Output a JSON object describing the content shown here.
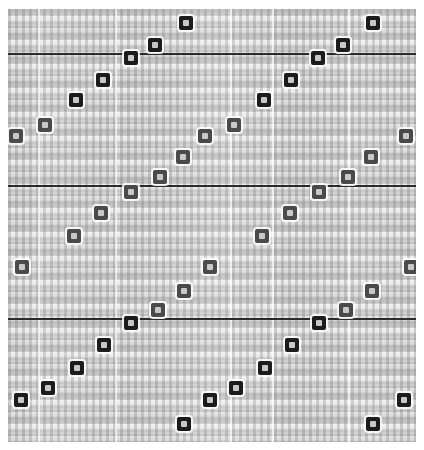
{
  "figure": {
    "title": "",
    "width": 424,
    "height": 450,
    "background_color": "#d2d2d2",
    "marker_dark_color": "#1c1c1c",
    "marker_mid_color": "#4a4a4a",
    "marker_light_color": "#6f6f6f",
    "marker_core_color": "#c8c8c8",
    "reference_line_color": "#2b2b2b",
    "gridline_color": "#ffffff"
  },
  "chart_data": {
    "type": "scatter",
    "title": "",
    "subtitle": "",
    "xlabel": "",
    "ylabel": "",
    "xlim": [
      0,
      2
    ],
    "ylim": [
      0,
      1
    ],
    "grid": true,
    "grid_axis": "x",
    "legend": false,
    "legend_position": "none",
    "note": "Phase-folded periodic scatter: markers repeat as two identical cycles across x; each cycle contains descending ramps (sawtooth). Greyscale of marker encodes an intensity value.",
    "reference_lines": {
      "orientation": "horizontal",
      "y_pixels": [
        53,
        185,
        318
      ],
      "y_values": [
        0.878,
        0.573,
        0.266
      ],
      "color": "#2b2b2b",
      "style": "solid"
    },
    "gridlines": {
      "orientation": "vertical",
      "x_pixels": [
        38,
        115,
        230,
        272,
        348
      ],
      "color": "#ffffff",
      "style": "solid"
    },
    "axis_ticks": {
      "x_labels": [],
      "y_labels": []
    },
    "series": [
      {
        "name": "folded points",
        "marker": "square",
        "points": [
          {
            "x_px": 186,
            "y_px": 23,
            "shade": "dark"
          },
          {
            "x_px": 373,
            "y_px": 23,
            "shade": "dark"
          },
          {
            "x_px": 155,
            "y_px": 45,
            "shade": "dark"
          },
          {
            "x_px": 343,
            "y_px": 45,
            "shade": "dark"
          },
          {
            "x_px": 131,
            "y_px": 58,
            "shade": "dark"
          },
          {
            "x_px": 318,
            "y_px": 58,
            "shade": "dark"
          },
          {
            "x_px": 103,
            "y_px": 80,
            "shade": "dark"
          },
          {
            "x_px": 291,
            "y_px": 80,
            "shade": "dark"
          },
          {
            "x_px": 76,
            "y_px": 100,
            "shade": "dark"
          },
          {
            "x_px": 264,
            "y_px": 100,
            "shade": "dark"
          },
          {
            "x_px": 45,
            "y_px": 125,
            "shade": "mid"
          },
          {
            "x_px": 234,
            "y_px": 125,
            "shade": "mid"
          },
          {
            "x_px": 16,
            "y_px": 136,
            "shade": "mid"
          },
          {
            "x_px": 205,
            "y_px": 136,
            "shade": "mid"
          },
          {
            "x_px": 406,
            "y_px": 136,
            "shade": "mid"
          },
          {
            "x_px": 183,
            "y_px": 157,
            "shade": "mid"
          },
          {
            "x_px": 371,
            "y_px": 157,
            "shade": "mid"
          },
          {
            "x_px": 160,
            "y_px": 177,
            "shade": "mid"
          },
          {
            "x_px": 348,
            "y_px": 177,
            "shade": "mid"
          },
          {
            "x_px": 131,
            "y_px": 192,
            "shade": "mid"
          },
          {
            "x_px": 319,
            "y_px": 192,
            "shade": "mid"
          },
          {
            "x_px": 101,
            "y_px": 213,
            "shade": "mid"
          },
          {
            "x_px": 290,
            "y_px": 213,
            "shade": "mid"
          },
          {
            "x_px": 74,
            "y_px": 236,
            "shade": "mid"
          },
          {
            "x_px": 262,
            "y_px": 236,
            "shade": "mid"
          },
          {
            "x_px": 22,
            "y_px": 267,
            "shade": "mid"
          },
          {
            "x_px": 210,
            "y_px": 267,
            "shade": "mid"
          },
          {
            "x_px": 411,
            "y_px": 267,
            "shade": "mid"
          },
          {
            "x_px": 184,
            "y_px": 291,
            "shade": "mid"
          },
          {
            "x_px": 372,
            "y_px": 291,
            "shade": "mid"
          },
          {
            "x_px": 158,
            "y_px": 310,
            "shade": "mid"
          },
          {
            "x_px": 346,
            "y_px": 310,
            "shade": "mid"
          },
          {
            "x_px": 131,
            "y_px": 323,
            "shade": "dark"
          },
          {
            "x_px": 319,
            "y_px": 323,
            "shade": "dark"
          },
          {
            "x_px": 104,
            "y_px": 345,
            "shade": "dark"
          },
          {
            "x_px": 292,
            "y_px": 345,
            "shade": "dark"
          },
          {
            "x_px": 77,
            "y_px": 368,
            "shade": "dark"
          },
          {
            "x_px": 265,
            "y_px": 368,
            "shade": "dark"
          },
          {
            "x_px": 48,
            "y_px": 388,
            "shade": "dark"
          },
          {
            "x_px": 236,
            "y_px": 388,
            "shade": "dark"
          },
          {
            "x_px": 21,
            "y_px": 400,
            "shade": "dark"
          },
          {
            "x_px": 210,
            "y_px": 400,
            "shade": "dark"
          },
          {
            "x_px": 404,
            "y_px": 400,
            "shade": "dark"
          },
          {
            "x_px": 184,
            "y_px": 424,
            "shade": "dark"
          },
          {
            "x_px": 373,
            "y_px": 424,
            "shade": "dark"
          }
        ]
      }
    ]
  }
}
